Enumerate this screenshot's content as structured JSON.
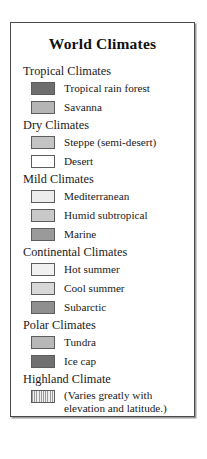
{
  "legend": {
    "title": "World Climates",
    "frame_border_color": "#4a4a4a",
    "groups": [
      {
        "header": "Tropical Climates",
        "entries": [
          {
            "label": "Tropical rain forest",
            "color": "#6e6e6e",
            "pattern": "solid"
          },
          {
            "label": "Savanna",
            "color": "#b5b5b5",
            "pattern": "solid"
          }
        ]
      },
      {
        "header": "Dry Climates",
        "entries": [
          {
            "label": "Steppe (semi-desert)",
            "color": "#c4c4c4",
            "pattern": "solid"
          },
          {
            "label": "Desert",
            "color": "#ffffff",
            "pattern": "solid"
          }
        ]
      },
      {
        "header": "Mild Climates",
        "entries": [
          {
            "label": "Mediterranean",
            "color": "#ececec",
            "pattern": "solid"
          },
          {
            "label": "Humid subtropical",
            "color": "#c9c9c9",
            "pattern": "solid"
          },
          {
            "label": "Marine",
            "color": "#9a9a9a",
            "pattern": "solid"
          }
        ]
      },
      {
        "header": "Continental Climates",
        "entries": [
          {
            "label": "Hot summer",
            "color": "#f1f1f1",
            "pattern": "solid"
          },
          {
            "label": "Cool summer",
            "color": "#d8d8d8",
            "pattern": "solid"
          },
          {
            "label": "Subarctic",
            "color": "#8f8f8f",
            "pattern": "solid"
          }
        ]
      },
      {
        "header": "Polar Climates",
        "entries": [
          {
            "label": "Tundra",
            "color": "#b8b8b8",
            "pattern": "solid"
          },
          {
            "label": "Ice cap",
            "color": "#707070",
            "pattern": "solid"
          }
        ]
      },
      {
        "header": "Highland Climate",
        "entries": [
          {
            "label": "(Varies greatly with\nelevation and latitude.)",
            "color": "#dcdcdc",
            "pattern": "hatched"
          }
        ]
      }
    ]
  }
}
